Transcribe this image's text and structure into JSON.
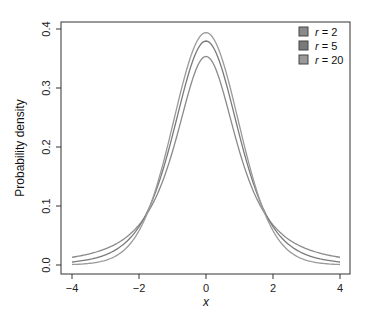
{
  "chart_data": {
    "type": "line",
    "title": "",
    "xlabel": "x",
    "ylabel": "Probability density",
    "xlim": [
      -4.2,
      4.3
    ],
    "ylim": [
      -0.015,
      0.41
    ],
    "x_ticks": [
      "-4",
      "-2",
      "0",
      "2",
      "4"
    ],
    "y_ticks": [
      "0.0",
      "0.1",
      "0.2",
      "0.3",
      "0.4"
    ],
    "grid": false,
    "legend_position": "top-right",
    "x": [
      -4,
      -3,
      -2,
      -1.5,
      -1,
      -0.5,
      0,
      0.5,
      1,
      1.5,
      2,
      3,
      4
    ],
    "series": [
      {
        "name": "r = 2",
        "label_var": "r",
        "label_val": "2",
        "color": "#8a8a8a",
        "values": [
          0.0131,
          0.0274,
          0.068,
          0.1134,
          0.1925,
          0.2963,
          0.3536,
          0.2963,
          0.1925,
          0.1134,
          0.068,
          0.0274,
          0.0131
        ]
      },
      {
        "name": "r = 5",
        "label_var": "r",
        "label_val": "5",
        "color": "#7a7a7a",
        "values": [
          0.0051,
          0.0173,
          0.0651,
          0.1245,
          0.2197,
          0.3279,
          0.3796,
          0.3279,
          0.2197,
          0.1245,
          0.0651,
          0.0173,
          0.0051
        ]
      },
      {
        "name": "r = 20",
        "label_var": "r",
        "label_val": "20",
        "color": "#9a9a9a",
        "values": [
          0.001,
          0.0079,
          0.0581,
          0.1269,
          0.236,
          0.3472,
          0.394,
          0.3472,
          0.236,
          0.1269,
          0.0581,
          0.0079,
          0.001
        ]
      }
    ]
  }
}
